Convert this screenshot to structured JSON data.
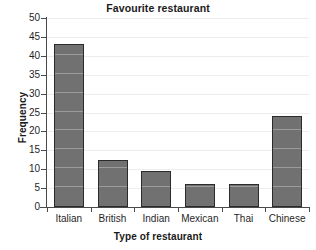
{
  "chart_data": {
    "type": "bar",
    "title": "Favourite restaurant",
    "xlabel": "Type of restaurant",
    "ylabel": "Frequency",
    "categories": [
      "Italian",
      "British",
      "Indian",
      "Mexican",
      "Thai",
      "Chinese"
    ],
    "values": [
      43,
      12.5,
      9.5,
      6,
      6,
      24
    ],
    "ylim": [
      0,
      50
    ],
    "ytick_labels": [
      "0",
      "5",
      "10",
      "15",
      "20",
      "25",
      "30",
      "35",
      "40",
      "45",
      "50"
    ],
    "ytick_values": [
      0,
      5,
      10,
      15,
      20,
      25,
      30,
      35,
      40,
      45,
      50
    ],
    "grid": true,
    "legend": false,
    "colors": {
      "bar_fill": "#717171",
      "bar_border": "#2b2b2b",
      "gridline": "#ededed",
      "axis": "#4a4a4a",
      "background": "#ffffff",
      "text": "#1f1f1f"
    }
  }
}
